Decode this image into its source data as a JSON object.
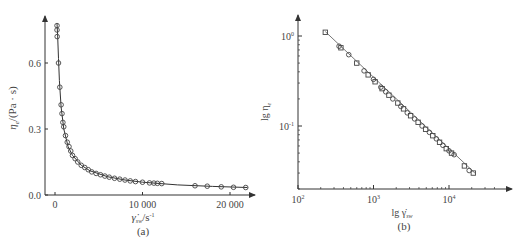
{
  "chart_data": [
    {
      "panel": "a",
      "type": "scatter",
      "caption": "(a)",
      "xlabel": "γ̇ sw/s⁻¹",
      "ylabel": "ηe/(Pa · s)",
      "xlim": [
        -1000,
        24000
      ],
      "ylim": [
        0,
        0.8
      ],
      "xticks": [
        0,
        10000,
        20000
      ],
      "xtick_labels": [
        "0",
        "10 000",
        "20 000"
      ],
      "yticks": [
        0.0,
        0.3,
        0.6
      ],
      "ytick_labels": [
        "0.0",
        "0.3",
        "0.6"
      ],
      "grid": false,
      "legend": null,
      "series": [
        {
          "name": "measured",
          "marker": "open-circle/square",
          "x": [
            230,
            230,
            250,
            400,
            550,
            700,
            800,
            900,
            1000,
            1200,
            1400,
            1600,
            1800,
            2000,
            2300,
            2600,
            3000,
            3400,
            3800,
            4200,
            4700,
            5200,
            5700,
            6200,
            6800,
            7400,
            8000,
            8600,
            9200,
            10000,
            10800,
            11300,
            11700,
            12200,
            16000,
            17400,
            19000,
            20400,
            21800
          ],
          "y": [
            0.77,
            0.75,
            0.72,
            0.6,
            0.49,
            0.41,
            0.37,
            0.33,
            0.31,
            0.27,
            0.24,
            0.22,
            0.2,
            0.18,
            0.165,
            0.15,
            0.135,
            0.125,
            0.115,
            0.105,
            0.098,
            0.092,
            0.086,
            0.081,
            0.076,
            0.072,
            0.068,
            0.064,
            0.061,
            0.058,
            0.055,
            0.054,
            0.053,
            0.052,
            0.042,
            0.04,
            0.037,
            0.035,
            0.034
          ]
        },
        {
          "name": "fit",
          "marker": "line",
          "x": [
            230,
            300,
            400,
            500,
            700,
            1000,
            1500,
            2000,
            3000,
            4000,
            6000,
            8000,
            10000,
            14000,
            18000,
            22000
          ],
          "y": [
            0.78,
            0.73,
            0.62,
            0.52,
            0.4,
            0.3,
            0.22,
            0.18,
            0.135,
            0.11,
            0.083,
            0.068,
            0.058,
            0.046,
            0.039,
            0.034
          ]
        }
      ]
    },
    {
      "panel": "b",
      "type": "scatter",
      "caption": "(b)",
      "xlabel": "lg γ̇ sw",
      "ylabel": "lg ηe",
      "xscale": "log",
      "yscale": "log",
      "xlim": [
        100,
        45000
      ],
      "ylim": [
        0.02,
        1.6
      ],
      "xticks": [
        100,
        1000,
        10000
      ],
      "xtick_labels": [
        "10²",
        "10³",
        "10⁴"
      ],
      "yticks": [
        1,
        0.1
      ],
      "ytick_labels": [
        "10⁰",
        "10⁻¹"
      ],
      "grid": false,
      "legend": null,
      "series": [
        {
          "name": "measured",
          "marker": "open-square/circle",
          "x": [
            230,
            350,
            370,
            470,
            600,
            750,
            850,
            1000,
            1050,
            1250,
            1300,
            1450,
            1600,
            1800,
            2100,
            2300,
            2500,
            2800,
            3100,
            3500,
            3900,
            4400,
            4900,
            5500,
            6100,
            6800,
            7500,
            8300,
            9200,
            10000,
            10800,
            11700,
            16000,
            18500,
            21000
          ],
          "y": [
            1.1,
            0.77,
            0.74,
            0.62,
            0.5,
            0.41,
            0.37,
            0.33,
            0.31,
            0.27,
            0.26,
            0.24,
            0.22,
            0.2,
            0.18,
            0.165,
            0.155,
            0.14,
            0.13,
            0.12,
            0.11,
            0.1,
            0.092,
            0.085,
            0.078,
            0.072,
            0.066,
            0.061,
            0.056,
            0.053,
            0.05,
            0.048,
            0.036,
            0.032,
            0.03
          ]
        },
        {
          "name": "fit",
          "marker": "line",
          "x": [
            230,
            22000
          ],
          "y": [
            1.12,
            0.03
          ]
        }
      ]
    }
  ],
  "panels": {
    "a": {
      "caption": "(a)",
      "ylabel_main": "η",
      "ylabel_sub": "e",
      "ylabel_unit": "/(Pa · s)",
      "xlabel_main": "γ̇",
      "xlabel_sub": "sw",
      "xlabel_unit": "/s",
      "xlabel_exp": "-1",
      "xticks": [
        "0",
        "10 000",
        "20 000"
      ],
      "yticks": [
        "0.0",
        "0.3",
        "0.6"
      ]
    },
    "b": {
      "caption": "(b)",
      "ylabel_main": "lg η",
      "ylabel_sub": "e",
      "xlabel_main": "lg γ̇",
      "xlabel_sub": "sw",
      "xticks": [
        {
          "base": "10",
          "exp": "2"
        },
        {
          "base": "10",
          "exp": "3"
        },
        {
          "base": "10",
          "exp": "4"
        }
      ],
      "yticks": [
        {
          "base": "10",
          "exp": "0"
        },
        {
          "base": "10",
          "exp": "-1"
        }
      ]
    }
  },
  "colors": {
    "axis": "#333333",
    "marker": "#444444",
    "line": "#333333",
    "text": "#444444"
  }
}
